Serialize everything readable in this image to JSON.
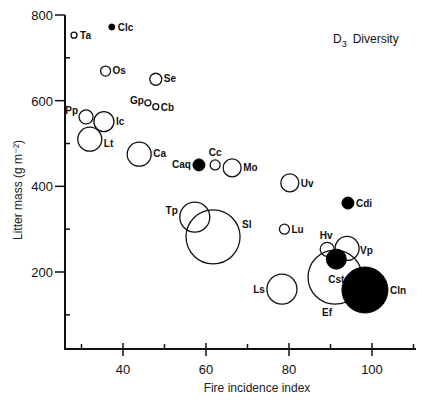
{
  "chart_data": {
    "type": "scatter",
    "title_main": "D",
    "title_sub": "3",
    "title_rest": "Diversity",
    "xlabel": "Fire incidence index",
    "ylabel": "Litter mass (g m⁻²)",
    "xlim": [
      25,
      110
    ],
    "ylim": [
      20,
      800
    ],
    "x_ticks": [
      40,
      60,
      80,
      100
    ],
    "x_minor_ticks": [
      30,
      50,
      70,
      90,
      110
    ],
    "y_ticks": [
      200,
      400,
      600,
      800
    ],
    "y_minor_ticks": [
      100,
      300,
      500,
      700
    ],
    "grid": false,
    "legend": "none",
    "size_encodes": "diversity (D3), bubble radius",
    "points": [
      {
        "label": "Ta",
        "x": 28.2,
        "y": 753,
        "r": 3,
        "filled": false,
        "lx": 6,
        "ly": 4,
        "anchor": "start"
      },
      {
        "label": "Clc",
        "x": 37.3,
        "y": 772,
        "r": 3,
        "filled": true,
        "lx": 6,
        "ly": 4,
        "anchor": "start"
      },
      {
        "label": "Os",
        "x": 35.8,
        "y": 669,
        "r": 5,
        "filled": false,
        "lx": 7,
        "ly": 3,
        "anchor": "start"
      },
      {
        "label": "Se",
        "x": 47.9,
        "y": 650,
        "r": 6,
        "filled": false,
        "lx": 8,
        "ly": 3,
        "anchor": "start"
      },
      {
        "label": "Gp",
        "x": 46.0,
        "y": 595,
        "r": 3,
        "filled": false,
        "lx": -4,
        "ly": 1,
        "anchor": "end"
      },
      {
        "label": "Cb",
        "x": 47.9,
        "y": 586,
        "r": 3,
        "filled": false,
        "lx": 5,
        "ly": 4,
        "anchor": "start"
      },
      {
        "label": "Pp",
        "x": 31.1,
        "y": 562,
        "r": 7,
        "filled": false,
        "lx": -8,
        "ly": -3,
        "anchor": "end"
      },
      {
        "label": "Ic",
        "x": 35.4,
        "y": 551,
        "r": 10,
        "filled": false,
        "lx": 12,
        "ly": 3,
        "anchor": "start"
      },
      {
        "label": "Lt",
        "x": 32.0,
        "y": 510,
        "r": 12,
        "filled": false,
        "lx": 14,
        "ly": 8,
        "anchor": "start"
      },
      {
        "label": "Ca",
        "x": 43.9,
        "y": 475,
        "r": 12,
        "filled": false,
        "lx": 14,
        "ly": 3,
        "anchor": "start"
      },
      {
        "label": "Caq",
        "x": 58.3,
        "y": 450,
        "r": 6,
        "filled": true,
        "lx": -8,
        "ly": 3,
        "anchor": "end"
      },
      {
        "label": "Cc",
        "x": 62.2,
        "y": 450,
        "r": 5,
        "filled": false,
        "lx": 0,
        "ly": -9,
        "anchor": "middle"
      },
      {
        "label": "Mo",
        "x": 66.3,
        "y": 443,
        "r": 9,
        "filled": false,
        "lx": 11,
        "ly": 3,
        "anchor": "start"
      },
      {
        "label": "Uv",
        "x": 80.2,
        "y": 408,
        "r": 9,
        "filled": false,
        "lx": 11,
        "ly": 4,
        "anchor": "start"
      },
      {
        "label": "Cdi",
        "x": 94.2,
        "y": 361,
        "r": 6,
        "filled": true,
        "lx": 8,
        "ly": 4,
        "anchor": "start"
      },
      {
        "label": "Tp",
        "x": 57.3,
        "y": 328,
        "r": 15,
        "filled": false,
        "lx": -17,
        "ly": -3,
        "anchor": "end"
      },
      {
        "label": "Sl",
        "x": 61.7,
        "y": 282,
        "r": 27,
        "filled": false,
        "lx": 29,
        "ly": -9,
        "anchor": "start"
      },
      {
        "label": "Lu",
        "x": 78.9,
        "y": 300,
        "r": 5,
        "filled": false,
        "lx": 7,
        "ly": 4,
        "anchor": "start"
      },
      {
        "label": "Hv",
        "x": 89.2,
        "y": 253,
        "r": 7,
        "filled": false,
        "lx": -1,
        "ly": -10,
        "anchor": "middle"
      },
      {
        "label": "Vp",
        "x": 94.0,
        "y": 255,
        "r": 12,
        "filled": false,
        "lx": 13,
        "ly": 6,
        "anchor": "start"
      },
      {
        "label": "Ef",
        "x": 91.1,
        "y": 188,
        "r": 27,
        "filled": false,
        "lx": -8,
        "ly": 39,
        "anchor": "middle"
      },
      {
        "label": "Cst",
        "x": 91.4,
        "y": 230,
        "r": 10,
        "filled": true,
        "lx": 0,
        "ly": 24,
        "anchor": "middle"
      },
      {
        "label": "Ls",
        "x": 78.3,
        "y": 160,
        "r": 15,
        "filled": false,
        "lx": -17,
        "ly": 4,
        "anchor": "end"
      },
      {
        "label": "Cln",
        "x": 98.3,
        "y": 158,
        "r": 23,
        "filled": true,
        "lx": 25,
        "ly": 4,
        "anchor": "start"
      }
    ]
  }
}
